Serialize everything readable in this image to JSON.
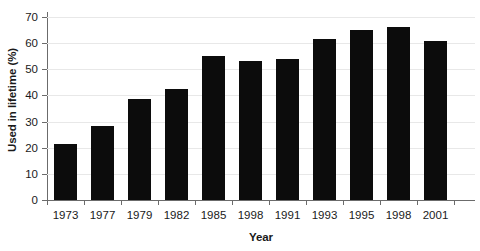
{
  "chart_data": {
    "type": "bar",
    "title": "",
    "subtitle": "",
    "xlabel": "Year",
    "ylabel": "Used in lifetime (%)",
    "categories": [
      "1973",
      "1977",
      "1979",
      "1982",
      "1985",
      "1998",
      "1991",
      "1993",
      "1995",
      "1998",
      "2001"
    ],
    "values": [
      21.5,
      28.5,
      38.5,
      42.5,
      55,
      53,
      54,
      61.5,
      65,
      66,
      61
    ],
    "ylim": [
      0,
      70
    ],
    "yticks": [
      0,
      10,
      20,
      30,
      40,
      50,
      60,
      70
    ],
    "ytick_labels": [
      "0",
      "10",
      "20",
      "30",
      "40",
      "50",
      "60",
      "70"
    ],
    "grid": true,
    "grid_axis": "y",
    "legend": false,
    "legend_position": "none",
    "bar_color": "#0c0c0c",
    "grid_color": "#e8e8e8",
    "axis_color": "#6b6b6b",
    "background_color": "#ffffff"
  }
}
